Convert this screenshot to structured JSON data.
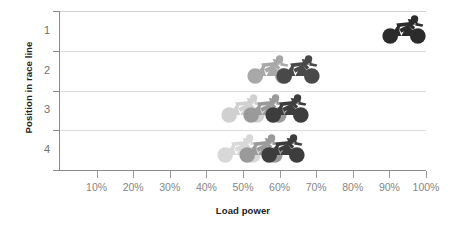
{
  "chart_data": {
    "type": "scatter",
    "title": "",
    "xlabel": "Load power",
    "ylabel": "Position in race line",
    "xlim": [
      0,
      100
    ],
    "x_unit": "%",
    "xticks": [
      10,
      20,
      30,
      40,
      50,
      60,
      70,
      80,
      90,
      100
    ],
    "xticklabels": [
      "10%",
      "20%",
      "30%",
      "40%",
      "50%",
      "60%",
      "70%",
      "80%",
      "90%",
      "100%"
    ],
    "ycategories": [
      "1",
      "2",
      "3",
      "4"
    ],
    "yticklabels": [
      "1",
      "2",
      "3",
      "4"
    ],
    "grid": "horizontal",
    "legend": "none",
    "marker": "cyclist-pictogram",
    "series": [
      {
        "name": "Position 1",
        "position": 1,
        "points": [
          {
            "x": 94,
            "shade": "#2b2b2b",
            "label": "lead rider"
          }
        ]
      },
      {
        "name": "Position 2",
        "position": 2,
        "points": [
          {
            "x": 57,
            "shade": "#a8a8a8",
            "label": "rider a"
          },
          {
            "x": 65,
            "shade": "#494949",
            "label": "rider b"
          }
        ]
      },
      {
        "name": "Position 3",
        "position": 3,
        "points": [
          {
            "x": 50,
            "shade": "#d0d0d0",
            "label": "rider a"
          },
          {
            "x": 56,
            "shade": "#9a9a9a",
            "label": "rider b"
          },
          {
            "x": 62,
            "shade": "#3d3d3d",
            "label": "rider c"
          }
        ]
      },
      {
        "name": "Position 4",
        "position": 4,
        "points": [
          {
            "x": 49,
            "shade": "#d8d8d8",
            "label": "rider a"
          },
          {
            "x": 55,
            "shade": "#9a9a9a",
            "label": "rider b"
          },
          {
            "x": 61,
            "shade": "#3d3d3d",
            "label": "rider c"
          }
        ]
      }
    ],
    "colors": {
      "gridline": "#dcdcdc",
      "axis": "#8a8a8a",
      "tick_label": "#868686",
      "axis_title": "#222222",
      "background": "#ffffff"
    }
  }
}
